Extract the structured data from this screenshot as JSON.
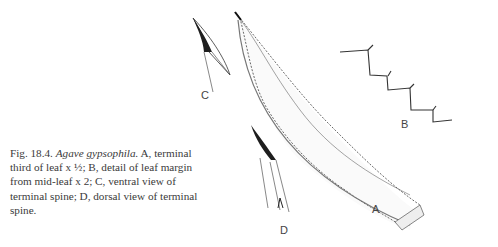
{
  "figure": {
    "number": "Fig. 18.4.",
    "species": "Agave gypsophila.",
    "caption_rest": " A, terminal third of leaf x ½; B, detail of leaf margin from mid-leaf x 2; C, ventral view of terminal spine; D, dorsal view of terminal spine.",
    "labels": {
      "a": "A",
      "b": "B",
      "c": "C",
      "d": "D"
    },
    "panels": [
      {
        "id": "A",
        "description": "terminal third of leaf x ½"
      },
      {
        "id": "B",
        "description": "detail of leaf margin from mid-leaf x 2"
      },
      {
        "id": "C",
        "description": "ventral view of terminal spine"
      },
      {
        "id": "D",
        "description": "dorsal view of terminal spine"
      }
    ],
    "ink_color": "#2a2a2a"
  }
}
